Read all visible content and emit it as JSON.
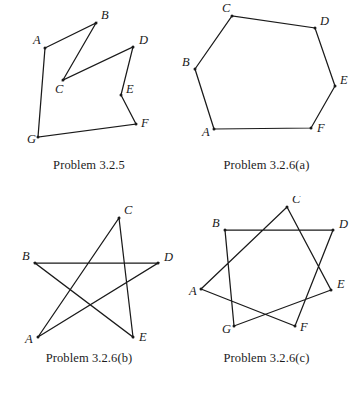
{
  "page": {
    "background_color": "#ffffff",
    "stroke_color": "#1a1a1a",
    "figure_count": 4
  },
  "figures": [
    {
      "id": "problem-3-2-5",
      "caption": "Problem 3.2.5",
      "shape_name": "non-convex-heptagon",
      "path_order": "A-B-C-D-E-F-G-A",
      "closed": true,
      "vertices": [
        {
          "label": "A",
          "x": 45,
          "y": 48,
          "label_x": 33,
          "label_y": 44
        },
        {
          "label": "B",
          "x": 96,
          "y": 23,
          "label_x": 101,
          "label_y": 19
        },
        {
          "label": "C",
          "x": 63,
          "y": 80,
          "label_x": 55,
          "label_y": 93
        },
        {
          "label": "D",
          "x": 133,
          "y": 47,
          "label_x": 139,
          "label_y": 44
        },
        {
          "label": "E",
          "x": 121,
          "y": 95,
          "label_x": 126,
          "label_y": 93
        },
        {
          "label": "F",
          "x": 136,
          "y": 124,
          "label_x": 141,
          "label_y": 127
        },
        {
          "label": "G",
          "x": 38,
          "y": 137,
          "label_x": 27,
          "label_y": 143
        }
      ]
    },
    {
      "id": "problem-3-2-6-a",
      "caption": "Problem 3.2.6(a)",
      "shape_name": "hexagram-star",
      "path_order": "A-B-C-D-E-F-A",
      "closed": true,
      "vertices": [
        {
          "label": "A",
          "x": 36,
          "y": 129,
          "label_x": 24,
          "label_y": 136
        },
        {
          "label": "B",
          "x": 17,
          "y": 69,
          "label_x": 4,
          "label_y": 66
        },
        {
          "label": "C",
          "x": 54,
          "y": 16,
          "label_x": 44,
          "label_y": 12
        },
        {
          "label": "D",
          "x": 137,
          "y": 28,
          "label_x": 142,
          "label_y": 25
        },
        {
          "label": "E",
          "x": 157,
          "y": 86,
          "label_x": 162,
          "label_y": 84
        },
        {
          "label": "F",
          "x": 133,
          "y": 128,
          "label_x": 139,
          "label_y": 132
        }
      ]
    },
    {
      "id": "problem-3-2-6-b",
      "caption": "Problem 3.2.6(b)",
      "shape_name": "pentagram-star",
      "path_order": "A-C-E-B-D-A",
      "closed": true,
      "vertices": [
        {
          "label": "A",
          "x": 38,
          "y": 141,
          "label_x": 25,
          "label_y": 147
        },
        {
          "label": "B",
          "x": 35,
          "y": 67,
          "label_x": 22,
          "label_y": 64
        },
        {
          "label": "C",
          "x": 119,
          "y": 22,
          "label_x": 124,
          "label_y": 18
        },
        {
          "label": "D",
          "x": 158,
          "y": 67,
          "label_x": 164,
          "label_y": 65
        },
        {
          "label": "E",
          "x": 133,
          "y": 141,
          "label_x": 139,
          "label_y": 145
        }
      ]
    },
    {
      "id": "problem-3-2-6-c",
      "caption": "Problem 3.2.6(c)",
      "shape_name": "heptagram-star",
      "path_order": "A-C-E-G-B-D-F-A",
      "closed": true,
      "vertices": [
        {
          "label": "A",
          "x": 23,
          "y": 93,
          "label_x": 11,
          "label_y": 99
        },
        {
          "label": "B",
          "x": 47,
          "y": 34,
          "label_x": 34,
          "label_y": 31
        },
        {
          "label": "C",
          "x": 109,
          "y": 11,
          "label_x": 114,
          "label_y": 7
        },
        {
          "label": "D",
          "x": 155,
          "y": 34,
          "label_x": 161,
          "label_y": 32
        },
        {
          "label": "E",
          "x": 153,
          "y": 94,
          "label_x": 159,
          "label_y": 92
        },
        {
          "label": "F",
          "x": 117,
          "y": 130,
          "label_x": 122,
          "label_y": 135
        },
        {
          "label": "G",
          "x": 56,
          "y": 130,
          "label_x": 44,
          "label_y": 137
        }
      ]
    }
  ]
}
